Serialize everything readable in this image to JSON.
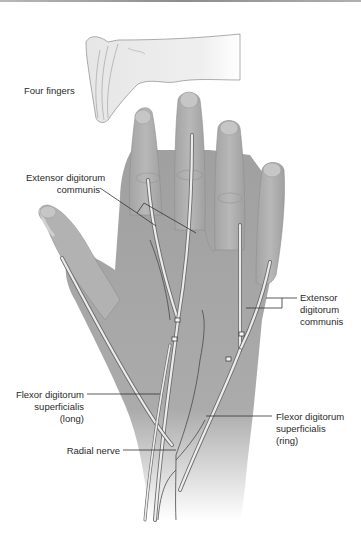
{
  "figure": {
    "labels": {
      "four_fingers": "Four fingers",
      "edc_left": "Extensor digitorum\ncommunis",
      "edc_right": "Extensor\ndigitorum\ncommunis",
      "fds_long": "Flexor digitorum\nsuperficialis\n(long)",
      "radial_nerve": "Radial nerve",
      "fds_ring": "Flexor digitorum\nsuperficialis\n(ring)"
    },
    "colors": {
      "skin_main": "#a8a8a8",
      "skin_light": "#c4c4c4",
      "skin_inset": "#ececec",
      "tendon": "#e8e8e8",
      "tendon_edge": "#6e6e6e",
      "leader_line": "#333333",
      "text": "#2a2a2a"
    }
  }
}
